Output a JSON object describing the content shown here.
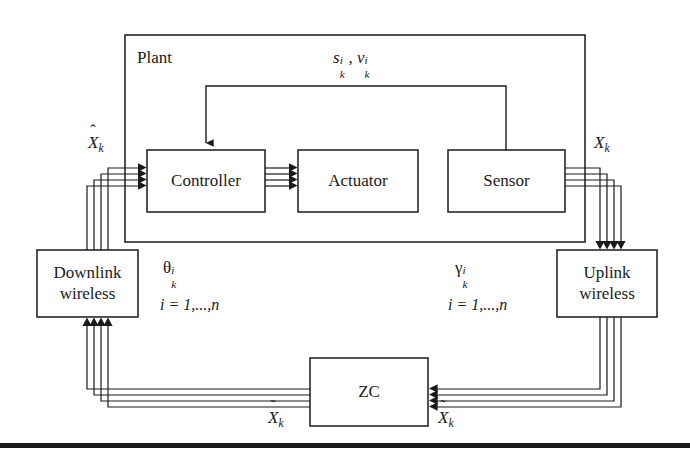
{
  "diagram": {
    "type": "block-diagram",
    "background_color": "#ffffff",
    "line_color": "#1a1a1a",
    "text_color": "#1a1a1a",
    "width": 690,
    "height": 463
  },
  "blocks": {
    "plant": {
      "label": "Plant",
      "x": 125,
      "y": 35,
      "w": 460,
      "h": 207,
      "label_x": 137,
      "label_y": 50
    },
    "controller": {
      "label": "Controller",
      "x": 147,
      "y": 150,
      "w": 118,
      "h": 62
    },
    "actuator": {
      "label": "Actuator",
      "x": 298,
      "y": 150,
      "w": 120,
      "h": 62
    },
    "sensor": {
      "label": "Sensor",
      "x": 448,
      "y": 150,
      "w": 117,
      "h": 62
    },
    "downlink_wireless": {
      "label_line1": "Downlink",
      "label_line2": "wireless",
      "x": 37,
      "y": 250,
      "w": 101,
      "h": 67
    },
    "uplink_wireless": {
      "label_line1": "Uplink",
      "label_line2": "wireless",
      "x": 557,
      "y": 250,
      "w": 100,
      "h": 67
    },
    "zc": {
      "label": "ZC",
      "x": 310,
      "y": 358,
      "w": 118,
      "h": 68
    }
  },
  "signals": {
    "noise_top": {
      "s_base": "s",
      "s_sup": "i",
      "s_sub": "k",
      "separator": ",",
      "v_base": "ν",
      "v_sup": "i",
      "v_sub": "k",
      "x": 333,
      "y": 48
    },
    "x_hat_k": {
      "accent": "ˆ",
      "base": "X",
      "sub": "k",
      "x": 88,
      "y": 133
    },
    "x_k": {
      "base": "X",
      "sub": "k",
      "x": 594,
      "y": 133
    },
    "x_tilde_left": {
      "accent": "˜",
      "base": "X",
      "sub": "k",
      "x": 268,
      "y": 408
    },
    "x_tilde_right": {
      "accent": "˜",
      "base": "X",
      "sub": "k",
      "x": 438,
      "y": 408
    },
    "theta": {
      "base": "θ",
      "sup": "i",
      "sub": "k",
      "index_text": "i = 1,...,n",
      "x": 163,
      "y": 258,
      "index_x": 160,
      "index_y": 296
    },
    "gamma": {
      "base": "γ",
      "sup": "i",
      "sub": "k",
      "index_text": "i = 1,...,n",
      "x": 455,
      "y": 258,
      "index_x": 448,
      "index_y": 296
    }
  },
  "connections": [
    {
      "name": "feedback-sensor-to-controller",
      "from": "sensor-top",
      "to": "controller-top",
      "style": "single-line-arrow"
    },
    {
      "name": "downlink-bus-to-controller",
      "from": "downlink-wireless-top",
      "to": "controller-left",
      "style": "four-line-bus-arrow"
    },
    {
      "name": "controller-to-actuator",
      "from": "controller-right",
      "to": "actuator-left",
      "style": "four-line-bus-arrow"
    },
    {
      "name": "sensor-to-uplink-bus",
      "from": "sensor-right",
      "to": "uplink-wireless-top",
      "style": "four-line-bus-arrow"
    },
    {
      "name": "uplink-to-zc-bus",
      "from": "uplink-wireless-bottom",
      "to": "zc-right",
      "style": "four-line-bus-arrow"
    },
    {
      "name": "zc-to-downlink-bus",
      "from": "zc-left",
      "to": "downlink-wireless-bottom",
      "style": "four-line-bus-arrow"
    }
  ],
  "footer_rule": {
    "name": "page-bottom-rule",
    "y": 445,
    "thickness": 5
  }
}
